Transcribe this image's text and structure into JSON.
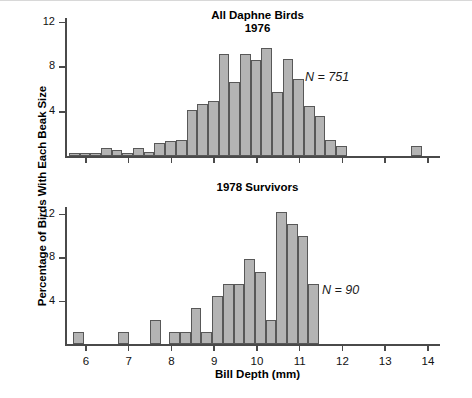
{
  "figure": {
    "ylabel": "Percentage of Birds With Each Beak Size",
    "xlabel": "Bill Depth (mm)"
  },
  "panels": [
    {
      "id": "all-daphne-birds-1976",
      "title_line1": "All Daphne Birds",
      "title_line2": "1976",
      "annotation": "N = 751"
    },
    {
      "id": "survivors-1978",
      "title_line1": "1978 Survivors",
      "title_line2": "",
      "annotation": "N = 90"
    }
  ],
  "axes": {
    "y_ticks": [
      4,
      8,
      12
    ],
    "y_tick_labels": [
      "4",
      "8",
      "12"
    ],
    "x_ticks": [
      6,
      7,
      8,
      9,
      10,
      11,
      12,
      13,
      14
    ],
    "x_tick_labels": [
      "6",
      "7",
      "8",
      "9",
      "10",
      "11",
      "12",
      "13",
      "14"
    ],
    "xlim": [
      5.6,
      14.3
    ],
    "ylim": [
      0,
      13.6
    ],
    "grid": false
  },
  "style": {
    "bar_fill": "#b4b4b4",
    "bar_stroke": "#585858",
    "axis_color": "#4a4a4a",
    "text_color": "#000000"
  },
  "chart_data": [
    {
      "type": "bar",
      "title": "All Daphne Birds 1976",
      "xlabel": "Bill Depth (mm)",
      "ylabel": "Percentage of Birds With Each Beak Size",
      "xlim": [
        5.6,
        14.3
      ],
      "ylim": [
        0,
        13.6
      ],
      "bin_width": 0.25,
      "annotation": "N = 751",
      "n": 751,
      "grid": false,
      "categories": [
        5.75,
        6.0,
        6.25,
        6.5,
        6.75,
        7.0,
        7.25,
        7.5,
        7.75,
        8.0,
        8.25,
        8.5,
        8.75,
        9.0,
        9.25,
        9.5,
        9.75,
        10.0,
        10.25,
        10.5,
        10.75,
        11.0,
        11.25,
        11.5,
        11.75,
        12.0,
        13.75
      ],
      "values": [
        0.25,
        0.25,
        0.25,
        0.75,
        0.55,
        0.3,
        0.75,
        0.4,
        1.15,
        1.3,
        1.45,
        4.1,
        4.65,
        4.95,
        9.1,
        6.6,
        9.1,
        8.55,
        9.65,
        5.75,
        8.7,
        6.85,
        4.5,
        3.6,
        1.4,
        0.85,
        0.85
      ]
    },
    {
      "type": "bar",
      "title": "1978 Survivors",
      "xlabel": "Bill Depth (mm)",
      "ylabel": "Percentage of Birds With Each Beak Size",
      "xlim": [
        5.6,
        14.3
      ],
      "ylim": [
        0,
        13.6
      ],
      "bin_width": 0.25,
      "annotation": "N = 90",
      "n": 90,
      "grid": false,
      "categories": [
        5.85,
        6.9,
        7.65,
        8.1,
        8.35,
        8.6,
        8.85,
        9.1,
        9.35,
        9.6,
        9.85,
        10.1,
        10.35,
        10.6,
        10.85,
        11.1,
        11.35
      ],
      "values": [
        1.1,
        1.1,
        2.2,
        1.1,
        1.1,
        3.3,
        1.1,
        4.4,
        5.5,
        5.5,
        7.8,
        6.6,
        2.2,
        12.2,
        11.1,
        10.0,
        5.5
      ]
    }
  ]
}
